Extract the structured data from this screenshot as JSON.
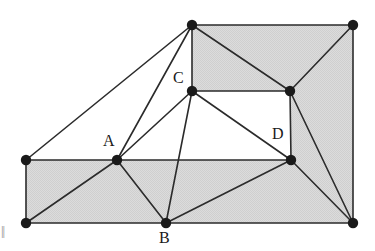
{
  "figure": {
    "canvas": {
      "width": 375,
      "height": 251
    },
    "colors": {
      "stroke": "#2b2b2b",
      "vertex_fill": "#1a1a1a",
      "shaded_fill": "#d6d6d6",
      "unshaded_fill": "#ffffff",
      "background": "#ffffff",
      "label_text": "#1a1a1a",
      "artifact_text": "#8c8c8c"
    },
    "stroke_width": 1.6,
    "vertex_radius": 5.2,
    "vertices": [
      {
        "id": "G",
        "x": 26,
        "y": 160,
        "labeled": false
      },
      {
        "id": "H",
        "x": 26,
        "y": 223,
        "labeled": false
      },
      {
        "id": "A",
        "x": 117,
        "y": 160,
        "labeled": true
      },
      {
        "id": "B",
        "x": 166,
        "y": 223,
        "labeled": true
      },
      {
        "id": "C",
        "x": 192,
        "y": 91,
        "labeled": true
      },
      {
        "id": "F",
        "x": 192,
        "y": 25,
        "labeled": false
      },
      {
        "id": "E",
        "x": 290,
        "y": 91,
        "labeled": false
      },
      {
        "id": "D",
        "x": 291,
        "y": 160,
        "labeled": true
      },
      {
        "id": "I",
        "x": 353,
        "y": 25,
        "labeled": false
      },
      {
        "id": "J",
        "x": 353,
        "y": 223,
        "labeled": false
      }
    ],
    "faces": [
      {
        "name": "face-F-G-A",
        "points": "192,25 26,160 117,160",
        "shaded": false
      },
      {
        "name": "face-F-A-C",
        "points": "192,25 117,160 192,91",
        "shaded": false
      },
      {
        "name": "face-A-C-D",
        "points": "117,160 192,91 291,160",
        "shaded": false
      },
      {
        "name": "face-C-E-D",
        "points": "192,91 290,91 291,160",
        "shaded": false
      },
      {
        "name": "face-F-C-E-I",
        "points": "192,25 192,91 290,91 353,25",
        "shaded": true
      },
      {
        "name": "face-E-I-J",
        "points": "290,91 353,25 353,223",
        "shaded": true
      },
      {
        "name": "face-E-J-D",
        "points": "290,91 353,223 291,160",
        "shaded": true
      },
      {
        "name": "face-D-J-B",
        "points": "291,160 353,223 166,223",
        "shaded": true
      },
      {
        "name": "face-A-D-B",
        "points": "117,160 291,160 166,223",
        "shaded": true
      },
      {
        "name": "face-A-B-H",
        "points": "117,160 166,223 26,223",
        "shaded": true
      },
      {
        "name": "face-G-A-H",
        "points": "26,160 117,160 26,223",
        "shaded": true
      }
    ],
    "edges": [
      {
        "name": "edge-G-H",
        "from": "G",
        "to": "H"
      },
      {
        "name": "edge-G-A",
        "from": "G",
        "to": "A"
      },
      {
        "name": "edge-G-F",
        "from": "G",
        "to": "F"
      },
      {
        "name": "edge-H-B",
        "from": "H",
        "to": "B"
      },
      {
        "name": "edge-H-A",
        "from": "H",
        "to": "A"
      },
      {
        "name": "edge-A-F",
        "from": "A",
        "to": "F"
      },
      {
        "name": "edge-A-C",
        "from": "A",
        "to": "C"
      },
      {
        "name": "edge-A-D",
        "from": "A",
        "to": "D"
      },
      {
        "name": "edge-A-B",
        "from": "A",
        "to": "B"
      },
      {
        "name": "edge-B-C",
        "from": "B",
        "to": "C"
      },
      {
        "name": "edge-B-D",
        "from": "B",
        "to": "D"
      },
      {
        "name": "edge-B-J",
        "from": "B",
        "to": "J"
      },
      {
        "name": "edge-C-F",
        "from": "C",
        "to": "F"
      },
      {
        "name": "edge-C-E",
        "from": "C",
        "to": "E"
      },
      {
        "name": "edge-C-D",
        "from": "C",
        "to": "D"
      },
      {
        "name": "edge-F-E",
        "from": "F",
        "to": "E"
      },
      {
        "name": "edge-F-I",
        "from": "F",
        "to": "I"
      },
      {
        "name": "edge-E-I",
        "from": "E",
        "to": "I"
      },
      {
        "name": "edge-E-D",
        "from": "E",
        "to": "D"
      },
      {
        "name": "edge-E-J",
        "from": "E",
        "to": "J"
      },
      {
        "name": "edge-D-J",
        "from": "D",
        "to": "J"
      },
      {
        "name": "edge-I-J",
        "from": "I",
        "to": "J"
      }
    ],
    "labels": [
      {
        "id": "label-A",
        "text": "A",
        "x": 103,
        "y": 133
      },
      {
        "id": "label-B",
        "text": "B",
        "x": 159,
        "y": 230
      },
      {
        "id": "label-C",
        "text": "C",
        "x": 173,
        "y": 70
      },
      {
        "id": "label-D",
        "text": "D",
        "x": 272,
        "y": 126
      }
    ],
    "artifact": {
      "text": "||",
      "note": "partial clipped glyph at left margin"
    }
  }
}
